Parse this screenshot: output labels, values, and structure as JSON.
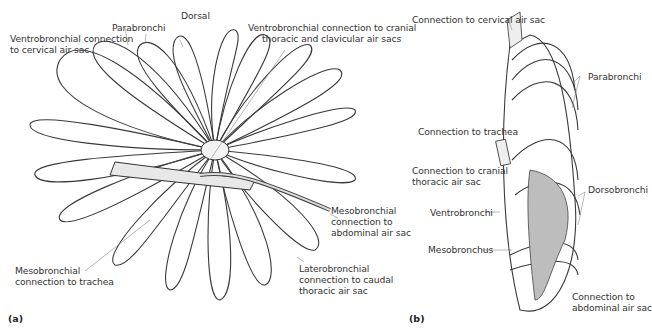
{
  "figure": {
    "panel_a": {
      "tag": "(a)",
      "labels": {
        "dorsal": "Dorsal",
        "parabronchi": "Parabronchi",
        "ventro_cervical_1": "Ventrobronchial connection",
        "ventro_cervical_2": "to cervical air sac",
        "ventro_cranial_1": "Ventrobronchial connection to cranial",
        "ventro_cranial_2": "thoracic and clavicular air sacs",
        "meso_abdominal_1": "Mesobronchial",
        "meso_abdominal_2": "connection to",
        "meso_abdominal_3": "abdominal air sac",
        "latero_caudal_1": "Laterobronchial",
        "latero_caudal_2": "connection to caudal",
        "latero_caudal_3": "thoracic air sac",
        "meso_trachea_1": "Mesobronchial",
        "meso_trachea_2": "connection to trachea"
      }
    },
    "panel_b": {
      "tag": "(b)",
      "labels": {
        "cervical": "Connection to cervical air sac",
        "parabronchi": "Parabronchi",
        "trachea": "Connection to trachea",
        "cranial_1": "Connection to cranial",
        "cranial_2": "thoracic air sac",
        "dorsobronchi": "Dorsobronchi",
        "ventrobronchi": "Ventrobronchi",
        "mesobronchus": "Mesobronchus",
        "abdominal_1": "Connection to",
        "abdominal_2": "abdominal air sac"
      }
    }
  }
}
